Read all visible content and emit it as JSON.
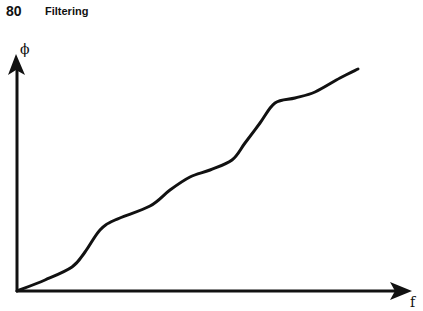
{
  "header": {
    "page_number": "80",
    "section_title": "Filtering"
  },
  "diagram": {
    "y_axis_label": "ϕ",
    "x_axis_label": "f",
    "curve_points": [
      [
        17,
        291
      ],
      [
        45,
        280
      ],
      [
        72,
        267
      ],
      [
        85,
        252
      ],
      [
        100,
        230
      ],
      [
        115,
        220
      ],
      [
        150,
        206
      ],
      [
        170,
        190
      ],
      [
        190,
        177
      ],
      [
        210,
        170
      ],
      [
        232,
        160
      ],
      [
        245,
        143
      ],
      [
        260,
        123
      ],
      [
        275,
        103
      ],
      [
        295,
        98
      ],
      [
        315,
        92
      ],
      [
        340,
        78
      ],
      [
        358,
        69
      ]
    ],
    "line_color": "#111111"
  }
}
